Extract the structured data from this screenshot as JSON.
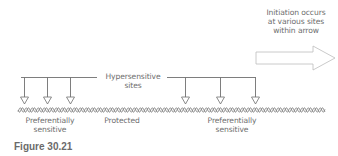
{
  "figure": {
    "caption": "Figure 30.21"
  },
  "labels": {
    "hypersensitive_line1": "Hypersensitive",
    "hypersensitive_line2": "sites",
    "initiation_line1": "Initiation occurs",
    "initiation_line2": "at various sites",
    "initiation_line3": "within arrow",
    "left_region_line1": "Preferentially",
    "left_region_line2": "sensitive",
    "middle_region": "Protected",
    "right_region_line1": "Preferentially",
    "right_region_line2": "sensitive"
  },
  "elements": {
    "left_arrows_count": 3,
    "right_arrows_count": 3,
    "dna_strand": "double-helix-wavy-line",
    "initiation_arrow": "hollow-right-arrow"
  },
  "colors": {
    "line": "#6f6f6f",
    "text": "#6e6e6e",
    "arrow_outline": "#b8b8b8"
  }
}
